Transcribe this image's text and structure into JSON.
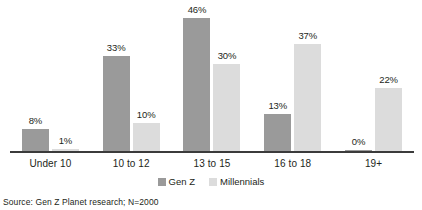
{
  "top_fragment": "",
  "legend": {
    "position": "bottom-center",
    "items": [
      {
        "label": "Gen Z",
        "color": "#9a9a9a",
        "swatch_name": "legend-swatch-gen-z"
      },
      {
        "label": "Millennials",
        "color": "#dcdcdc",
        "swatch_name": "legend-swatch-millennials"
      }
    ]
  },
  "source_note": "Source: Gen Z Planet research; N=2000",
  "colors": {
    "gen_z": "#9a9a9a",
    "millennials": "#dcdcdc",
    "axis": "#3b3b3b",
    "text": "#231f20",
    "background": "#ffffff"
  },
  "chart_data": {
    "type": "bar",
    "title": "",
    "subtitle": "",
    "xlabel": "",
    "ylabel": "",
    "categories": [
      "Under 10",
      "10 to 12",
      "13 to 15",
      "16 to 18",
      "19+"
    ],
    "series": [
      {
        "name": "Gen Z",
        "color": "#9a9a9a",
        "values": [
          8,
          33,
          46,
          13,
          0
        ],
        "labels": [
          "8%",
          "33%",
          "46%",
          "13%",
          "0%"
        ]
      },
      {
        "name": "Millennials",
        "color": "#dcdcdc",
        "values": [
          1,
          10,
          30,
          37,
          22
        ],
        "labels": [
          "1%",
          "10%",
          "30%",
          "37%",
          "22%"
        ]
      }
    ],
    "value_unit": "%",
    "ylim": [
      0,
      50
    ],
    "grid": false,
    "legend_position": "bottom-center",
    "data_labels_shown": true,
    "axis_tick_labels_y": []
  }
}
